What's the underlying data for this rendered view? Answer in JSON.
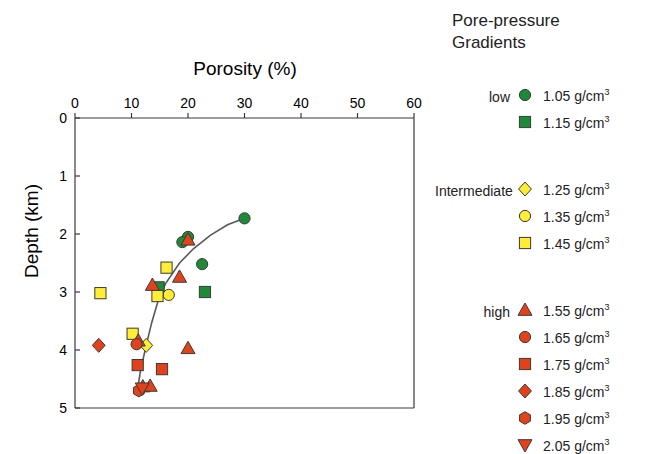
{
  "chart_data": {
    "type": "scatter",
    "title": "",
    "xlabel": "Porosity (%)",
    "ylabel": "Depth (km)",
    "xlim": [
      0,
      60
    ],
    "ylim": [
      0,
      5
    ],
    "y_inverted": true,
    "xticks": [
      0,
      10,
      20,
      30,
      40,
      50,
      60
    ],
    "yticks": [
      0,
      1,
      2,
      3,
      4,
      5
    ],
    "grid": false,
    "legend_position": "right",
    "trend_line": {
      "name": "compaction-trend",
      "color": "#58585a",
      "points": [
        [
          11.0,
          4.72
        ],
        [
          11.6,
          4.35
        ],
        [
          12.6,
          3.92
        ],
        [
          13.6,
          3.52
        ],
        [
          14.8,
          3.12
        ],
        [
          16.0,
          2.86
        ],
        [
          18.5,
          2.5
        ],
        [
          21.0,
          2.25
        ],
        [
          24.0,
          2.02
        ],
        [
          27.0,
          1.84
        ],
        [
          30.0,
          1.73
        ]
      ]
    },
    "series": [
      {
        "name": "1.05 g/cm3",
        "marker": "circle",
        "color": "#1e8a37",
        "group": "low",
        "points": [
          [
            20.0,
            2.05
          ],
          [
            19.0,
            2.14
          ],
          [
            22.5,
            2.52
          ],
          [
            30.0,
            1.73
          ]
        ]
      },
      {
        "name": "1.15 g/cm3",
        "marker": "square",
        "color": "#1e8a37",
        "group": "low",
        "points": [
          [
            14.8,
            2.92
          ],
          [
            23.0,
            3.0
          ]
        ]
      },
      {
        "name": "1.25 g/cm3",
        "marker": "diamond",
        "color": "#ffee33",
        "group": "Intermediate",
        "points": [
          [
            12.6,
            3.92
          ]
        ]
      },
      {
        "name": "1.35 g/cm3",
        "marker": "circle",
        "color": "#ffee33",
        "group": "Intermediate",
        "points": [
          [
            16.6,
            3.05
          ]
        ]
      },
      {
        "name": "1.45 g/cm3",
        "marker": "square",
        "color": "#ffee33",
        "group": "Intermediate",
        "points": [
          [
            16.2,
            2.58
          ],
          [
            14.6,
            3.07
          ],
          [
            4.5,
            3.02
          ],
          [
            10.2,
            3.72
          ]
        ]
      },
      {
        "name": "1.55 g/cm3",
        "marker": "triangle",
        "color": "#e2421a",
        "group": "high",
        "points": [
          [
            20.0,
            2.1
          ],
          [
            18.5,
            2.74
          ],
          [
            13.7,
            2.88
          ],
          [
            11.2,
            3.84
          ],
          [
            20.0,
            3.97
          ],
          [
            12.0,
            4.63
          ],
          [
            13.3,
            4.62
          ]
        ]
      },
      {
        "name": "1.65 g/cm3",
        "marker": "circle",
        "color": "#e2421a",
        "group": "high",
        "points": [
          [
            10.9,
            3.9
          ]
        ]
      },
      {
        "name": "1.75 g/cm3",
        "marker": "square",
        "color": "#e2421a",
        "group": "high",
        "points": [
          [
            11.1,
            4.26
          ],
          [
            15.4,
            4.33
          ]
        ]
      },
      {
        "name": "1.85 g/cm3",
        "marker": "diamond",
        "color": "#e2421a",
        "group": "high",
        "points": [
          [
            4.2,
            3.92
          ]
        ]
      },
      {
        "name": "1.95 g/cm3",
        "marker": "hexagon",
        "color": "#e2421a",
        "group": "high",
        "points": [
          [
            11.3,
            4.7
          ]
        ]
      },
      {
        "name": "2.05 g/cm3",
        "marker": "triangle-down",
        "color": "#e2421a",
        "group": "high",
        "points": [
          [
            11.9,
            4.66
          ]
        ]
      }
    ]
  },
  "legend": {
    "title_line1": "Pore-pressure",
    "title_line2": "Gradients",
    "groups": [
      {
        "label": "low",
        "items": [
          {
            "marker": "circle",
            "color": "#1e8a37",
            "value": "1.05",
            "unit": "g/cm",
            "exp": "3"
          },
          {
            "marker": "square",
            "color": "#1e8a37",
            "value": "1.15",
            "unit": "g/cm",
            "exp": "3"
          }
        ]
      },
      {
        "label": "Intermediate",
        "items": [
          {
            "marker": "diamond",
            "color": "#ffee33",
            "value": "1.25",
            "unit": "g/cm",
            "exp": "3"
          },
          {
            "marker": "circle",
            "color": "#ffee33",
            "value": "1.35",
            "unit": "g/cm",
            "exp": "3"
          },
          {
            "marker": "square",
            "color": "#ffee33",
            "value": "1.45",
            "unit": "g/cm",
            "exp": "3"
          }
        ]
      },
      {
        "label": "high",
        "items": [
          {
            "marker": "triangle",
            "color": "#e2421a",
            "value": "1.55",
            "unit": "g/cm",
            "exp": "3"
          },
          {
            "marker": "circle",
            "color": "#e2421a",
            "value": "1.65",
            "unit": "g/cm",
            "exp": "3"
          },
          {
            "marker": "square",
            "color": "#e2421a",
            "value": "1.75",
            "unit": "g/cm",
            "exp": "3"
          },
          {
            "marker": "diamond",
            "color": "#e2421a",
            "value": "1.85",
            "unit": "g/cm",
            "exp": "3"
          },
          {
            "marker": "hexagon",
            "color": "#e2421a",
            "value": "1.95",
            "unit": "g/cm",
            "exp": "3"
          },
          {
            "marker": "triangle-down",
            "color": "#e2421a",
            "value": "2.05",
            "unit": "g/cm",
            "exp": "3"
          }
        ]
      }
    ]
  },
  "colors": {
    "green": "#1e8a37",
    "yellow": "#ffee33",
    "red": "#e2421a",
    "axis": "#3a3a3a",
    "trend": "#58585a",
    "marker_outline": "#3a3a3a"
  }
}
